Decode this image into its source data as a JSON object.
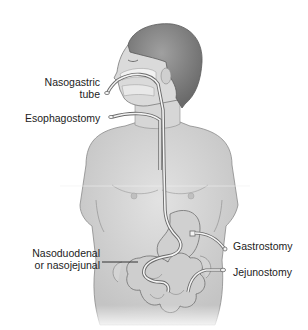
{
  "diagram": {
    "labels": {
      "nasogastric_line1": "Nasogastric",
      "nasogastric_line2": "tube",
      "esophagostomy": "Esophagostomy",
      "nasoduodenal_line1": "Nasoduodenal",
      "nasoduodenal_line2": "or nasojejunal",
      "gastrostomy": "Gastrostomy",
      "jejunostomy": "Jejunostomy"
    },
    "colors": {
      "background": "#ffffff",
      "skin": "#d9d9d9",
      "skin_shadow": "#b8b8b8",
      "hair": "#8a8a8a",
      "outline": "#6e6e6e",
      "organ": "#cfcfcf",
      "tube": "#f4f4f4",
      "text": "#222222"
    }
  }
}
